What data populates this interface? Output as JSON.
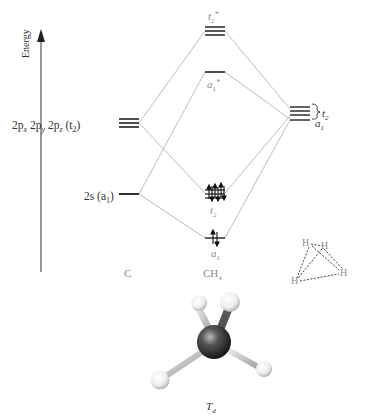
{
  "axis": {
    "label": "Energy"
  },
  "carbon": {
    "column_label": "C",
    "p_orbital_label": [
      "2p",
      "x",
      " 2p",
      "y",
      " 2p",
      "z",
      " (t",
      "2",
      ")"
    ],
    "s_orbital_label": [
      "2s (a",
      "1",
      ")"
    ]
  },
  "methane": {
    "column_label_main": "CH",
    "column_label_sub": "4",
    "t2_star": {
      "main": "t",
      "sub": "2",
      "sup": "*"
    },
    "a1_star": {
      "main": "a",
      "sub": "1",
      "sup": "*"
    },
    "t2_bonding": {
      "main": "t",
      "sub": "2"
    },
    "a1_bonding": {
      "main": "a",
      "sub": "1"
    }
  },
  "hydrogen": {
    "t2_label": {
      "main": "t",
      "sub": "2"
    },
    "a1_label": {
      "main": "a",
      "sub": "1"
    },
    "tetrahedron_atoms": [
      "H",
      "H",
      "H",
      "H"
    ]
  },
  "molecule": {
    "symmetry_main": "T",
    "symmetry_sub": "d"
  },
  "colors": {
    "level": "#222222",
    "connector": "#b5b5b5",
    "label_grey": "#8a8a8a",
    "carbon_atom": "#2a2a2a",
    "hydrogen_atom": "#f0f0f0"
  }
}
